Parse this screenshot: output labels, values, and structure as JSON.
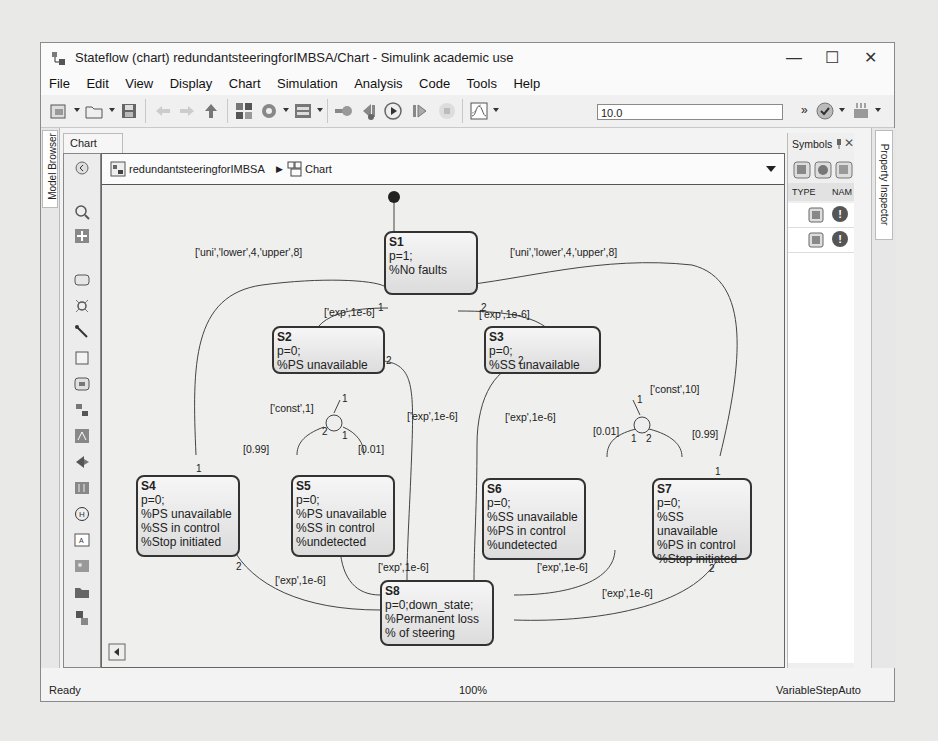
{
  "window": {
    "title": "Stateflow (chart) redundantsteeringforIMBSA/Chart - Simulink academic use",
    "controls": {
      "minimize": "—",
      "maximize": "☐",
      "close": "✕"
    }
  },
  "menubar": [
    "File",
    "Edit",
    "View",
    "Display",
    "Chart",
    "Simulation",
    "Analysis",
    "Code",
    "Tools",
    "Help"
  ],
  "toolbar": {
    "icons": [
      "new-model-icon",
      "open-icon",
      "save-icon",
      "back-icon",
      "forward-icon",
      "up-icon",
      "library-browser-icon",
      "model-config-icon",
      "model-explorer-icon",
      "debug-icon",
      "step-back-icon",
      "run-icon",
      "step-forward-icon",
      "stop-icon",
      "scope-icon",
      "model-advisor-icon",
      "build-icon"
    ],
    "stop_time": "10.0",
    "overflow": "»"
  },
  "left_tab": {
    "label": "Model Browser"
  },
  "chart_tab": {
    "label": "Chart"
  },
  "breadcrumb": {
    "model": "redundantsteeringforIMBSA",
    "separator": "▶",
    "chart": "Chart"
  },
  "palette": [
    "zoom-icon",
    "fit-icon",
    "state-icon",
    "junction-icon",
    "default-transition-icon",
    "box-icon",
    "simulink-function-icon",
    "graphical-function-icon",
    "matlab-function-icon",
    "history-junction-icon",
    "truth-table-icon",
    "history-icon",
    "annotation-icon",
    "image-icon",
    "subchart-icon",
    "subsystem-icon"
  ],
  "symbols_panel": {
    "title": "Symbols",
    "columns": [
      "TYPE",
      "NAM"
    ],
    "rows": [
      {
        "type": "data-icon",
        "status": "!"
      },
      {
        "type": "data-icon",
        "status": "!"
      }
    ]
  },
  "right_tab": {
    "label": "Property Inspector"
  },
  "states": [
    {
      "id": "S1",
      "lines": [
        "p=1;",
        "%No faults"
      ]
    },
    {
      "id": "S2",
      "lines": [
        "p=0;",
        "%PS unavailable"
      ]
    },
    {
      "id": "S3",
      "lines": [
        "p=0;",
        "%SS unavailable"
      ]
    },
    {
      "id": "S4",
      "lines": [
        "p=0;",
        "%PS unavailable",
        "%SS in control",
        "%Stop initiated"
      ]
    },
    {
      "id": "S5",
      "lines": [
        "p=0;",
        "%PS unavailable",
        "%SS in control",
        "%undetected"
      ]
    },
    {
      "id": "S6",
      "lines": [
        "p=0;",
        "%SS unavailable",
        "%PS in control",
        "%undetected"
      ]
    },
    {
      "id": "S7",
      "lines": [
        "p=0;",
        "%SS unavailable",
        "%PS in control",
        "%Stop initiated"
      ]
    },
    {
      "id": "S8",
      "lines": [
        "p=0;down_state;",
        "%Permanent loss",
        "% of steering"
      ]
    }
  ],
  "transitions": {
    "s4_s1": "['uni','lower',4,'upper',8]",
    "s7_s1": "['uni','lower',4,'upper',8]",
    "s1_s2": "['exp',1e-6]",
    "s1_s3": "['exp',1e-6]",
    "s2_j1": "['const',1]",
    "s3_j2": "['const',10]",
    "j1_s4": "[0.99]",
    "j1_s5": "[0.01]",
    "j2_s6": "[0.01]",
    "j2_s7": "[0.99]",
    "s2_s8": "['exp',1e-6]",
    "s3_s8": "['exp',1e-6]",
    "s4_s8": "['exp',1e-6]",
    "s5_s8": "['exp',1e-6]",
    "s6_s8": "['exp',1e-6]",
    "s7_s8": "['exp',1e-6]"
  },
  "execution_orders": {
    "one": "1",
    "two": "2"
  },
  "statusbar": {
    "left": "Ready",
    "center": "100%",
    "right": "VariableStepAuto"
  }
}
